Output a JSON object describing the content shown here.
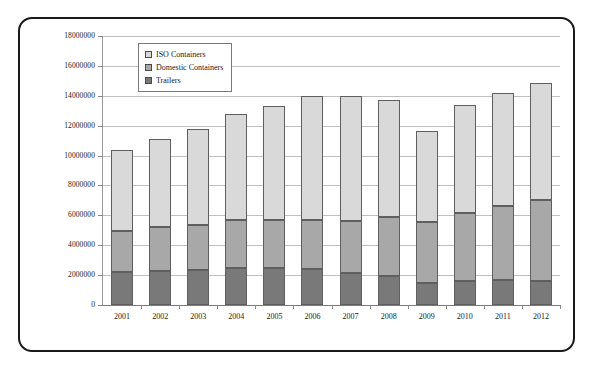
{
  "chart_data": {
    "type": "bar",
    "subtype": "stacked",
    "title": "",
    "xlabel": "",
    "ylabel": "",
    "categories": [
      "2001",
      "2002",
      "2003",
      "2004",
      "2005",
      "2006",
      "2007",
      "2008",
      "2009",
      "2010",
      "2011",
      "2012"
    ],
    "series": [
      {
        "name": "Trailers",
        "color": "#797979",
        "values": [
          2200000,
          2250000,
          2350000,
          2500000,
          2500000,
          2400000,
          2150000,
          1950000,
          1500000,
          1600000,
          1700000,
          1600000
        ]
      },
      {
        "name": "Domestic Containers",
        "color": "#a8a8a8",
        "values": [
          2750000,
          2950000,
          3000000,
          3200000,
          3200000,
          3300000,
          3500000,
          3950000,
          4050000,
          4550000,
          4900000,
          5450000
        ]
      },
      {
        "name": "ISO Containers",
        "color": "#d9d9d9",
        "values": [
          5450000,
          5900000,
          6450000,
          7100000,
          7650000,
          8300000,
          8350000,
          7800000,
          6100000,
          7250000,
          7600000,
          7800000
        ]
      }
    ],
    "totals": [
      10400000,
      11100000,
      11800000,
      12800000,
      13350000,
      14000000,
      14000000,
      13700000,
      11650000,
      13400000,
      14200000,
      14850000
    ],
    "ylim": [
      0,
      18000000
    ],
    "ytick_step": 2000000,
    "ytick_labels": [
      "0",
      "2000000",
      "4000000",
      "6000000",
      "8000000",
      "10000000",
      "12000000",
      "14000000",
      "16000000",
      "18000000"
    ],
    "ytick_values": [
      0,
      2000000,
      4000000,
      6000000,
      8000000,
      10000000,
      12000000,
      14000000,
      16000000,
      18000000
    ],
    "grid": true,
    "legend_position": "top-left-inside",
    "legend": [
      {
        "label": "ISO Containers",
        "color": "#d9d9d9"
      },
      {
        "label": "Domestic Containers",
        "color": "#a8a8a8"
      },
      {
        "label": "Trailers",
        "color": "#797979"
      }
    ]
  }
}
